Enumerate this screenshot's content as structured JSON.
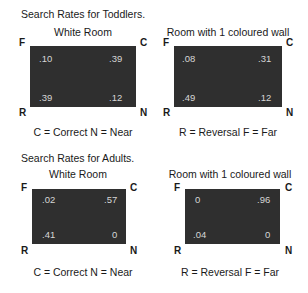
{
  "toddlers": {
    "title": "Search Rates for Toddlers.",
    "white_room": {
      "subtitle": "White Room",
      "values": {
        "F": ".10",
        "C": ".39",
        "R": ".39",
        "N": ".12"
      },
      "legend": "C = Correct  N = Near"
    },
    "coloured_room": {
      "subtitle": "Room with 1 coloured wall",
      "values": {
        "F": ".08",
        "C": ".31",
        "R": ".49",
        "N": ".12"
      },
      "legend": "R = Reversal  F = Far"
    }
  },
  "adults": {
    "title": "Search Rates for Adults.",
    "white_room": {
      "subtitle": "White Room",
      "values": {
        "F": ".02",
        "C": ".57",
        "R": ".41",
        "N": "0"
      },
      "legend": "C = Correct  N = Near"
    },
    "coloured_room": {
      "subtitle": "Room with 1 coloured wall",
      "values": {
        "F": "0",
        "C": ".96",
        "R": ".04",
        "N": "0"
      },
      "legend": "R = Reversal  F = Far"
    }
  },
  "corners": {
    "F": "F",
    "C": "C",
    "R": "R",
    "N": "N"
  },
  "colors": {
    "box": "#2f2f2f",
    "value_text": "#d6d6d6",
    "label_text": "#1a1a1a"
  }
}
